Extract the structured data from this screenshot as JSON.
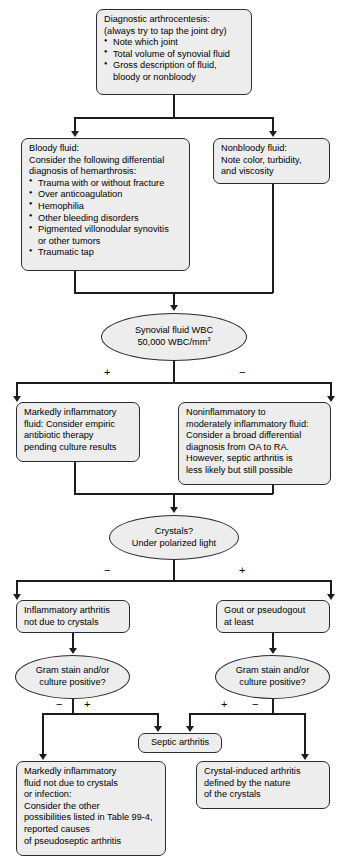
{
  "diagram": {
    "colors": {
      "node_fill": "#ededed",
      "node_border": "#2b2b2b",
      "connector": "#1d1d1d",
      "background": "#ffffff",
      "text": "#000000"
    },
    "signs": {
      "plus": "+",
      "minus": "−"
    }
  },
  "nodes": {
    "arthrocentesis": {
      "shape": "box",
      "line1": "Diagnostic arthrocentesis:",
      "line2": "(always try to tap the joint dry)",
      "bullets": [
        "Note which joint",
        "Total volume of synovial fluid",
        "Gross description of fluid,"
      ],
      "continuation": "bloody or nonbloody"
    },
    "bloody_fluid": {
      "shape": "box",
      "line1": "Bloody fluid:",
      "line2": "Consider the following differential",
      "line3": "diagnosis of hemarthrosis:",
      "bullets": [
        "Trauma with or without fracture",
        "Over anticoagulation",
        "Hemophilia",
        "Other bleeding disorders",
        "Pigmented villonodular synovitis"
      ],
      "continuation": "or other tumors",
      "last_bullet": "Traumatic tap"
    },
    "nonbloody_fluid": {
      "shape": "box",
      "line1": "Nonbloody fluid:",
      "line2": "Note color, turbidity,",
      "line3": "and viscosity"
    },
    "wbc_decision": {
      "shape": "oval",
      "line1": "Synovial fluid WBC",
      "line2_prefix": "50,000 WBC/mm",
      "line2_sup": "3",
      "branch_left_sign": "+",
      "branch_right_sign": "−"
    },
    "markedly_inflammatory": {
      "shape": "box",
      "line1": "Markedly inflammatory",
      "line2": "fluid: Consider empiric",
      "line3": "antibiotic therapy",
      "line4": "pending culture results"
    },
    "noninflammatory": {
      "shape": "box",
      "line1": "Noninflammatory to",
      "line2": "moderately inflammatory fluid:",
      "line3": "Consider a broad differential",
      "line4": "diagnosis from OA to RA.",
      "line5": "However, septic arthritis is",
      "line6": "less likely but still possible"
    },
    "crystals_decision": {
      "shape": "oval",
      "line1": "Crystals?",
      "line2": "Under polarized light",
      "branch_left_sign": "−",
      "branch_right_sign": "+"
    },
    "inflammatory_arthritis": {
      "shape": "box",
      "line1": "Inflammatory arthritis",
      "line2": "not due to crystals"
    },
    "gout": {
      "shape": "box",
      "line1": "Gout or pseudogout",
      "line2": "at least"
    },
    "gram_stain_left": {
      "shape": "oval",
      "line1": "Gram stain and/or",
      "line2": "culture positive?",
      "branch_left_sign": "−",
      "branch_right_sign": "+"
    },
    "gram_stain_right": {
      "shape": "oval",
      "line1": "Gram stain and/or",
      "line2": "culture positive?",
      "branch_left_sign": "+",
      "branch_right_sign": "−"
    },
    "septic_arthritis": {
      "shape": "box",
      "line1": "Septic arthritis"
    },
    "pseudoseptic": {
      "shape": "box",
      "line1": "Markedly inflammatory",
      "line2": "fluid not due to crystals",
      "line3": "or infection:",
      "line4": "Consider the other",
      "line5": "possibilities listed in Table 99-4,",
      "line6": "reported causes",
      "line7": "of pseudoseptic arthritis"
    },
    "crystal_induced": {
      "shape": "box",
      "line1": "Crystal-induced arthritis",
      "line2": "defined by the nature",
      "line3": "of the crystals"
    }
  }
}
